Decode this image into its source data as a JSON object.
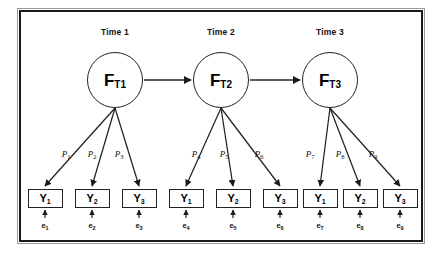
{
  "figure": {
    "type": "sem-path-diagram",
    "title_visible": false,
    "border_color": "#1a1a1a",
    "background": "#ffffff",
    "stroke_color": "#222222"
  },
  "time_headers": [
    {
      "label": "Time 1",
      "x": 115,
      "y": 27
    },
    {
      "label": "Time 2",
      "x": 221,
      "y": 27
    },
    {
      "label": "Time 3",
      "x": 330,
      "y": 27
    }
  ],
  "factors": [
    {
      "name": "F",
      "subscript": "T1",
      "cx": 115,
      "cy": 80
    },
    {
      "name": "F",
      "subscript": "T2",
      "cx": 221,
      "cy": 80
    },
    {
      "name": "F",
      "subscript": "T3",
      "cx": 330,
      "cy": 80
    }
  ],
  "structural_paths": [
    {
      "from": "F_T1",
      "to": "F_T2",
      "label": "",
      "x1": 144,
      "y1": 80,
      "x2": 191,
      "y2": 80
    },
    {
      "from": "F_T2",
      "to": "F_T3",
      "label": "",
      "x1": 250,
      "y1": 80,
      "x2": 300,
      "y2": 80
    }
  ],
  "indicators": [
    {
      "name": "Y",
      "subscript": "1",
      "cx": 45,
      "y": 189,
      "time": "Time 1"
    },
    {
      "name": "Y",
      "subscript": "2",
      "cx": 92,
      "y": 189,
      "time": "Time 1"
    },
    {
      "name": "Y",
      "subscript": "3",
      "cx": 139,
      "y": 189,
      "time": "Time 1"
    },
    {
      "name": "Y",
      "subscript": "1",
      "cx": 186,
      "y": 189,
      "time": "Time 2"
    },
    {
      "name": "Y",
      "subscript": "2",
      "cx": 233,
      "y": 189,
      "time": "Time 2"
    },
    {
      "name": "Y",
      "subscript": "3",
      "cx": 280,
      "y": 189,
      "time": "Time 2"
    },
    {
      "name": "Y",
      "subscript": "1",
      "cx": 320,
      "y": 189,
      "time": "Time 3"
    },
    {
      "name": "Y",
      "subscript": "2",
      "cx": 360,
      "y": 189,
      "time": "Time 3"
    },
    {
      "name": "Y",
      "subscript": "3",
      "cx": 400,
      "y": 189,
      "time": "Time 3"
    }
  ],
  "loadings": [
    {
      "name": "P",
      "subscript": "1",
      "x": 66,
      "y": 150,
      "from_cx": 115,
      "to_cx": 45
    },
    {
      "name": "P",
      "subscript": "2",
      "x": 92,
      "y": 150,
      "from_cx": 115,
      "to_cx": 92
    },
    {
      "name": "P",
      "subscript": "3",
      "x": 119,
      "y": 150,
      "from_cx": 115,
      "to_cx": 139
    },
    {
      "name": "P",
      "subscript": "4",
      "x": 196,
      "y": 150,
      "from_cx": 221,
      "to_cx": 186
    },
    {
      "name": "P",
      "subscript": "5",
      "x": 224,
      "y": 150,
      "from_cx": 221,
      "to_cx": 233
    },
    {
      "name": "P",
      "subscript": "6",
      "x": 259,
      "y": 150,
      "from_cx": 221,
      "to_cx": 280
    },
    {
      "name": "P",
      "subscript": "7",
      "x": 310,
      "y": 150,
      "from_cx": 330,
      "to_cx": 320
    },
    {
      "name": "P",
      "subscript": "8",
      "x": 340,
      "y": 150,
      "from_cx": 330,
      "to_cx": 360
    },
    {
      "name": "P",
      "subscript": "9",
      "x": 373,
      "y": 150,
      "from_cx": 330,
      "to_cx": 400
    }
  ],
  "errors": [
    {
      "name": "e",
      "subscript": "1",
      "cx": 45,
      "y": 222
    },
    {
      "name": "e",
      "subscript": "2",
      "cx": 92,
      "y": 222
    },
    {
      "name": "e",
      "subscript": "3",
      "cx": 139,
      "y": 222
    },
    {
      "name": "e",
      "subscript": "4",
      "cx": 186,
      "y": 222
    },
    {
      "name": "e",
      "subscript": "5",
      "cx": 233,
      "y": 222
    },
    {
      "name": "e",
      "subscript": "6",
      "cx": 280,
      "y": 222
    },
    {
      "name": "e",
      "subscript": "7",
      "cx": 320,
      "y": 222
    },
    {
      "name": "e",
      "subscript": "8",
      "cx": 360,
      "y": 222
    },
    {
      "name": "e",
      "subscript": "9",
      "cx": 400,
      "y": 222
    }
  ]
}
